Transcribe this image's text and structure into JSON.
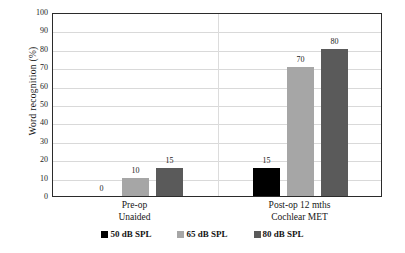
{
  "chart_data": {
    "type": "bar",
    "title": "",
    "xlabel": "",
    "ylabel": "Word  recognition  (%)",
    "ylim": [
      0,
      100
    ],
    "ytick_step": 10,
    "ytick_labels": [
      "100",
      "90",
      "80",
      "70",
      "60",
      "50",
      "40",
      "30",
      "20",
      "10",
      "0"
    ],
    "grid": true,
    "grid_axis": "y",
    "legend_position": "bottom",
    "categories": [
      "Pre-op\nUnaided",
      "Post-op 12 mths\nCochlear MET"
    ],
    "category_lines": [
      [
        "Pre-op",
        "Unaided"
      ],
      [
        "Post-op 12 mths",
        "Cochlear MET"
      ]
    ],
    "series": [
      {
        "name": "50 dB SPL",
        "color": "#000000",
        "values": [
          0,
          15
        ]
      },
      {
        "name": "65 dB SPL",
        "color": "#a6a6a6",
        "values": [
          10,
          70
        ]
      },
      {
        "name": "80 dB SPL",
        "color": "#5a5a5a",
        "values": [
          15,
          80
        ]
      }
    ],
    "data_labels": [
      {
        "text": "0",
        "series": "50 dB SPL",
        "category": "Pre-op Unaided",
        "value": 0
      },
      {
        "text": "10",
        "series": "65 dB SPL",
        "category": "Pre-op Unaided",
        "value": 10
      },
      {
        "text": "15",
        "series": "80 dB SPL",
        "category": "Pre-op Unaided",
        "value": 15
      },
      {
        "text": "15",
        "series": "50 dB SPL",
        "category": "Post-op 12 mths Cochlear MET",
        "value": 15
      },
      {
        "text": "70",
        "series": "65 dB SPL",
        "category": "Post-op 12 mths Cochlear MET",
        "value": 70
      },
      {
        "text": "80",
        "series": "80 dB SPL",
        "category": "Post-op 12 mths Cochlear MET",
        "value": 80
      }
    ]
  },
  "legend": {
    "items": [
      {
        "label": "50 dB SPL",
        "color": "#000000"
      },
      {
        "label": "65 dB SPL",
        "color": "#a6a6a6"
      },
      {
        "label": "80 dB SPL",
        "color": "#5a5a5a"
      }
    ]
  },
  "colors": {
    "plot_border": "#2b2b2b",
    "gridline": "#d9d9d9",
    "background": "#ffffff",
    "text": "#171717"
  }
}
